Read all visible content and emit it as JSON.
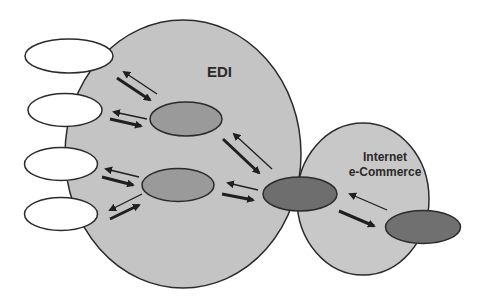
{
  "diagram": {
    "regions": [
      {
        "id": "edi",
        "label": "EDI",
        "fill": "#c4c4c4"
      },
      {
        "id": "internet",
        "label_line1": "Internet",
        "label_line2": "e-Commerce",
        "fill": "#c8c8c8"
      }
    ],
    "nodes": {
      "external_partners": 4,
      "edi_intermediaries": 2,
      "hub": 1,
      "internet_node": 1
    },
    "colors": {
      "outline": "#2b2b2b",
      "external_fill": "#ffffff",
      "intermediary_fill": "#9a9a9a",
      "hub_fill": "#6e6e6e",
      "internet_node_fill": "#707070",
      "arrow": "#1f1f1f"
    }
  }
}
